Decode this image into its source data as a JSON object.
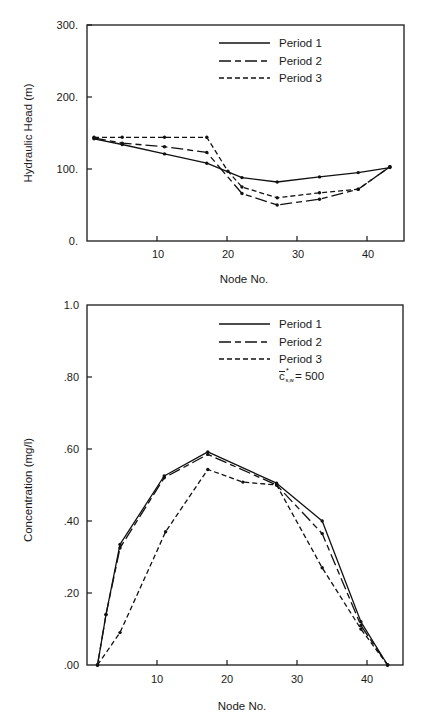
{
  "chart_data": [
    {
      "type": "line",
      "title": "",
      "xlabel": "Node No.",
      "ylabel": "Hydraulic Head (m)",
      "xlim": [
        0,
        45
      ],
      "ylim": [
        0,
        300
      ],
      "xticks": [
        10,
        20,
        30,
        40
      ],
      "xtick_labels": [
        "10",
        "20",
        "30",
        "40"
      ],
      "yticks": [
        0,
        100,
        200,
        300
      ],
      "ytick_labels": [
        "0.",
        "100.",
        "200.",
        "300."
      ],
      "grid": false,
      "legend_position": "upper right",
      "series": [
        {
          "name": "Period 1",
          "style": "solid",
          "x": [
            1,
            5,
            11,
            17,
            22,
            27,
            33,
            38.5,
            43
          ],
          "y": [
            142,
            134,
            121,
            108,
            88,
            82,
            89,
            95,
            102
          ]
        },
        {
          "name": "Period 2",
          "style": "long-dash",
          "x": [
            1,
            5,
            11,
            17,
            22,
            27,
            33,
            38.5,
            43
          ],
          "y": [
            143,
            136,
            131,
            123,
            66,
            50,
            58,
            72,
            103
          ]
        },
        {
          "name": "Period 3",
          "style": "short-dash",
          "x": [
            1,
            5,
            11,
            17,
            20,
            22,
            27,
            33,
            38.5,
            43
          ],
          "y": [
            144,
            144,
            144,
            144,
            97,
            75,
            60,
            67,
            72,
            103
          ]
        }
      ]
    },
    {
      "type": "line",
      "title": "",
      "xlabel": "Node No.",
      "ylabel": "Concentration (mg/l)",
      "xlim": [
        0,
        45
      ],
      "ylim": [
        0,
        1.0
      ],
      "xticks": [
        10,
        20,
        30,
        40
      ],
      "xtick_labels": [
        "10",
        "20",
        "30",
        "40"
      ],
      "yticks": [
        0,
        0.2,
        0.4,
        0.6,
        0.8,
        1.0
      ],
      "ytick_labels": [
        ".00",
        ".20",
        ".40",
        ".60",
        ".80",
        "1.0"
      ],
      "grid": false,
      "legend_position": "upper right",
      "annotation": "c̄*s,w = 500",
      "series": [
        {
          "name": "Period 1",
          "style": "solid",
          "x": [
            1.5,
            2.7,
            4.7,
            11,
            17.2,
            27,
            33.5,
            39,
            42.8
          ],
          "y": [
            0.0,
            0.14,
            0.335,
            0.525,
            0.592,
            0.505,
            0.4,
            0.12,
            0.0
          ]
        },
        {
          "name": "Period 2",
          "style": "long-dash",
          "x": [
            1.5,
            2.7,
            4.7,
            11,
            17.2,
            27,
            33.5,
            39,
            42.8
          ],
          "y": [
            0.0,
            0.14,
            0.325,
            0.52,
            0.585,
            0.5,
            0.365,
            0.11,
            0.0
          ]
        },
        {
          "name": "Period 3",
          "style": "short-dash",
          "x": [
            1.5,
            4.7,
            11.2,
            17.2,
            22.2,
            27,
            33.5,
            39,
            42.8
          ],
          "y": [
            0.0,
            0.09,
            0.37,
            0.543,
            0.508,
            0.5,
            0.27,
            0.1,
            0.0
          ]
        }
      ]
    }
  ],
  "top_chart": {
    "ylabel": "Hydraulic Head (m)",
    "xlabel": "Node No.",
    "yticks": [
      "300.",
      "200.",
      "100.",
      "0."
    ],
    "xticks": [
      "10",
      "20",
      "30",
      "40"
    ],
    "legend": [
      "Period 1",
      "Period 2",
      "Period 3"
    ]
  },
  "bottom_chart": {
    "ylabel": "Concentration (mg/l)",
    "xlabel": "Node No.",
    "yticks": [
      "1.0",
      ".80",
      ".60",
      ".40",
      ".20",
      ".00"
    ],
    "xticks": [
      "10",
      "20",
      "30",
      "40"
    ],
    "legend": [
      "Period 1",
      "Period 2",
      "Period 3"
    ],
    "annotation": {
      "symbol": "c",
      "subscript": "s,w",
      "superscript": "*",
      "value": "= 500"
    }
  }
}
